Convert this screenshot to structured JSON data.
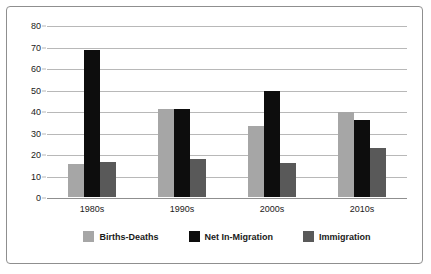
{
  "chart_data": {
    "type": "bar",
    "title": "",
    "subtitle": "",
    "xlabel": "",
    "ylabel": "",
    "categories": [
      "1980s",
      "1990s",
      "2000s",
      "2010s"
    ],
    "series": [
      {
        "name": "Births-Deaths",
        "color": "#a6a6a6",
        "values": [
          15.5,
          41.0,
          33.0,
          39.5
        ]
      },
      {
        "name": "Net In-Migration",
        "color": "#0d0d0d",
        "values": [
          68.5,
          41.0,
          49.5,
          36.0
        ]
      },
      {
        "name": "Immigration",
        "color": "#595959",
        "values": [
          16.5,
          17.5,
          16.0,
          23.0
        ]
      }
    ],
    "ylim": [
      0,
      80
    ],
    "ytick_step": 10,
    "ytick_labels": [
      "80",
      "70",
      "60",
      "50",
      "40",
      "30",
      "20",
      "10",
      "0"
    ],
    "grid": true,
    "legend_position": "bottom"
  },
  "frame": {
    "border_color": "#8f8f8f",
    "background": "#ffffff"
  }
}
